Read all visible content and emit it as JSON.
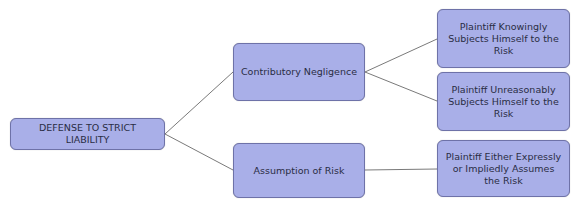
{
  "diagram": {
    "type": "tree",
    "root": {
      "label": "DEFENSE TO STRICT LIABILITY"
    },
    "branches": [
      {
        "label": "Contributory Negligence",
        "children": [
          {
            "label": "Plaintiff Knowingly Subjects Himself to the Risk"
          },
          {
            "label": "Plaintiff Unreasonably Subjects Himself to the Risk"
          }
        ]
      },
      {
        "label": "Assumption of Risk",
        "children": [
          {
            "label": "Plaintiff Either Expressly or Impliedly Assumes the Risk"
          }
        ]
      }
    ],
    "colors": {
      "node_fill": "#a9afe8",
      "node_border": "#6e72a8",
      "edge": "#7a7a7a",
      "text": "#2a2d44"
    }
  }
}
